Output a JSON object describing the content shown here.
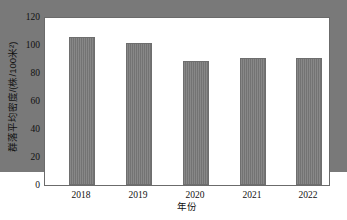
{
  "chart_data": {
    "type": "bar",
    "title": "",
    "xlabel": "年份",
    "ylabel": "群落平均密度/(株/100米²)",
    "categories": [
      "2018",
      "2019",
      "2020",
      "2021",
      "2022"
    ],
    "values": [
      94,
      106,
      102,
      89,
      91
    ],
    "ylim": [
      0,
      120
    ],
    "ytick_labels": [
      "0",
      "20",
      "40",
      "60",
      "80",
      "100",
      "120"
    ],
    "ytick_values": [
      0,
      20,
      40,
      60,
      80,
      100,
      120
    ],
    "ytick_minor_values": [
      10,
      30,
      50,
      70,
      90,
      110
    ],
    "grid": false,
    "legend": null,
    "series": [
      {
        "name": "群落平均密度",
        "values": [
          94,
          106,
          102,
          89,
          91
        ]
      }
    ],
    "bar_color": "#797979",
    "frame_color": "#6b6b6b",
    "bar_width_ratio": 0.3
  }
}
